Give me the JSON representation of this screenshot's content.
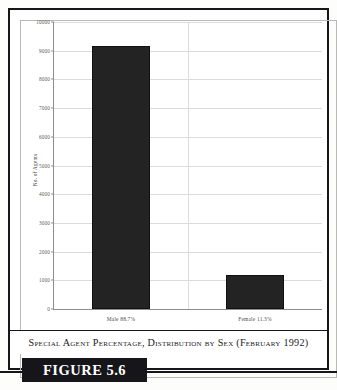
{
  "figure": {
    "banner_label": "FIGURE 5.6",
    "caption": "Special Agent Percentage, Distribution by Sex (February 1992)",
    "banner_background": "#16161a",
    "banner_text_color": "#ffffff",
    "frame_color": "#16161a"
  },
  "chart_data": {
    "type": "bar",
    "title": "",
    "subtitle": "",
    "xlabel": "",
    "ylabel": "No. of Agents",
    "categories": [
      "Male  88.7%",
      "Female  11.3%"
    ],
    "category_names": [
      "Male",
      "Female"
    ],
    "category_percentages": [
      "88.7%",
      "11.3%"
    ],
    "values": [
      9150,
      1200
    ],
    "series": [
      {
        "name": "No. of Agents",
        "values": [
          9150,
          1200
        ],
        "color": "#232323"
      }
    ],
    "ylim": [
      0,
      10000
    ],
    "ytick_step": 1000,
    "yticks": [
      10000,
      9000,
      8000,
      7000,
      6000,
      5000,
      4000,
      3000,
      2000,
      1000,
      0
    ],
    "ytick_labels": [
      "10000",
      "9000",
      "8000",
      "7000",
      "6000",
      "5000",
      "4000",
      "3000",
      "2000",
      "1000",
      "0"
    ],
    "grid": true,
    "grid_axis": "y",
    "grid_color": "#dcdcda",
    "axis_color": "#8d8d8a",
    "legend": false,
    "legend_position": "none",
    "bar_color": "#232323",
    "background": "#ffffff"
  }
}
